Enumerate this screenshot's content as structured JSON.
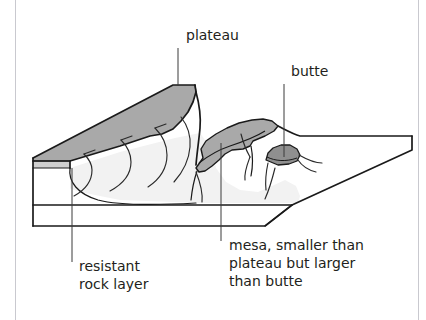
{
  "figure": {
    "background_color": "#ffffff",
    "frame_color": "#c9c9cf",
    "ink_color": "#231f20"
  },
  "labels": {
    "plateau": {
      "text": "plateau",
      "x": 186,
      "y": 40,
      "leader": {
        "x1": 178,
        "y1": 48,
        "x2": 178,
        "y2": 86
      }
    },
    "butte": {
      "text": "butte",
      "x": 291,
      "y": 76,
      "leader": {
        "x1": 284,
        "y1": 84,
        "x2": 284,
        "y2": 157
      }
    },
    "resistant_rock_layer": {
      "lines": [
        "resistant",
        "rock layer"
      ],
      "x": 79,
      "y": 271,
      "line_height": 18,
      "leader": {
        "x1": 72,
        "y1": 168,
        "x2": 72,
        "y2": 262
      }
    },
    "mesa": {
      "lines": [
        "mesa, smaller than",
        "plateau but larger",
        "than butte"
      ],
      "x": 229,
      "y": 250,
      "line_height": 18,
      "leader": {
        "x1": 221,
        "y1": 143,
        "x2": 221,
        "y2": 241
      }
    }
  },
  "terrain": {
    "surfaces": [
      {
        "name": "plateau-caprock-top",
        "color": "#a9a9a9"
      },
      {
        "name": "plateau-caprock-edge",
        "color": "#cfcfcf"
      },
      {
        "name": "eroded-slope",
        "color": "#f2f2f2"
      },
      {
        "name": "lowland-plain",
        "color": "#ffffff"
      },
      {
        "name": "block-front-face",
        "color": "#ffffff"
      },
      {
        "name": "mesa-caprock",
        "color": "#a9a9a9"
      },
      {
        "name": "butte-caprock",
        "color": "#8f8f8f"
      }
    ],
    "features": [
      {
        "name": "plateau",
        "kind": "large-tableland",
        "caprock": true
      },
      {
        "name": "mesa",
        "kind": "medium-tableland",
        "caprock": true
      },
      {
        "name": "butte",
        "kind": "small-isolated-hill",
        "caprock": true
      },
      {
        "name": "resistant-rock-layer",
        "kind": "stratum",
        "caprock": true
      }
    ]
  }
}
